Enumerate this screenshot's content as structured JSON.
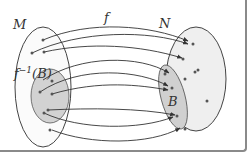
{
  "diagram": {
    "set_domain_label": "M",
    "set_codomain_label": "N",
    "function_label": "f",
    "preimage_label_prefix": "f",
    "preimage_label_superscript": "−1",
    "preimage_label_arg": "(B)",
    "subset_label": "B",
    "colors": {
      "outline": "#444444",
      "set_fill": "#f0f0f0",
      "subset_fill": "#d0d0d0",
      "arrow": "#333333",
      "point": "#555555",
      "frame": "#8a8a8a"
    }
  }
}
